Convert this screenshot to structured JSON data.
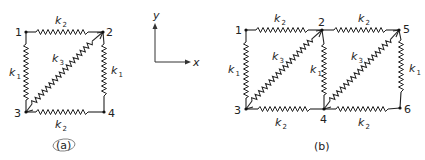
{
  "figure_a": {
    "label": "(a)",
    "nodes": [
      {
        "id": "1",
        "x": 26,
        "y": 32
      },
      {
        "id": "2",
        "x": 103,
        "y": 32
      },
      {
        "id": "3",
        "x": 26,
        "y": 112
      },
      {
        "id": "4",
        "x": 104,
        "y": 112
      }
    ],
    "springs": [
      {
        "from": "1",
        "to": "2",
        "k": "k",
        "sub": "2"
      },
      {
        "from": "3",
        "to": "4",
        "k": "k",
        "sub": "2"
      },
      {
        "from": "1",
        "to": "3",
        "k": "k",
        "sub": "1"
      },
      {
        "from": "2",
        "to": "4",
        "k": "k",
        "sub": "1"
      },
      {
        "from": "3",
        "to": "2",
        "k": "k",
        "sub": "3"
      }
    ]
  },
  "figure_b": {
    "label": "(b)",
    "nodes": [
      {
        "id": "1",
        "x": 246,
        "y": 30
      },
      {
        "id": "2",
        "x": 322,
        "y": 30
      },
      {
        "id": "5",
        "x": 399,
        "y": 30
      },
      {
        "id": "3",
        "x": 246,
        "y": 109
      },
      {
        "id": "4",
        "x": 324,
        "y": 109
      },
      {
        "id": "6",
        "x": 400,
        "y": 108
      }
    ],
    "springs": [
      {
        "from": "1",
        "to": "2",
        "k": "k",
        "sub": "2"
      },
      {
        "from": "2",
        "to": "5",
        "k": "k",
        "sub": "2"
      },
      {
        "from": "3",
        "to": "4",
        "k": "k",
        "sub": "2"
      },
      {
        "from": "4",
        "to": "6",
        "k": "k",
        "sub": "2"
      },
      {
        "from": "1",
        "to": "3",
        "k": "k",
        "sub": "1"
      },
      {
        "from": "2",
        "to": "4",
        "k": "k",
        "sub": "1"
      },
      {
        "from": "5",
        "to": "6",
        "k": "k",
        "sub": "1"
      },
      {
        "from": "3",
        "to": "2",
        "k": "k",
        "sub": "3"
      },
      {
        "from": "4",
        "to": "5",
        "k": "k",
        "sub": "3"
      }
    ]
  },
  "axes": {
    "x_label": "x",
    "y_label": "y"
  },
  "labels": {
    "k": "k",
    "sub1": "1",
    "sub2": "2",
    "sub3": "3"
  }
}
